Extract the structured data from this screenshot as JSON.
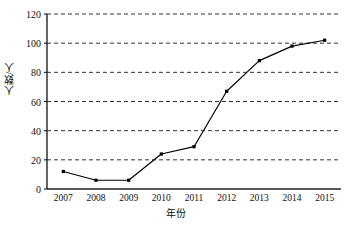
{
  "chart_data": {
    "type": "line",
    "title": "",
    "xlabel": "年份",
    "ylabel": "人数/人",
    "categories": [
      "2007",
      "2008",
      "2009",
      "2010",
      "2011",
      "2012",
      "2013",
      "2014",
      "2015"
    ],
    "values": [
      12,
      6,
      6,
      24,
      29,
      67,
      88,
      98,
      102
    ],
    "series": [
      {
        "name": "人数",
        "values": [
          12,
          6,
          6,
          24,
          29,
          67,
          88,
          98,
          102
        ]
      }
    ],
    "ylim": [
      0,
      120
    ],
    "yticks": [
      0,
      20,
      40,
      60,
      80,
      100,
      120
    ],
    "ytick_labels": [
      "0",
      "20",
      "40",
      "60",
      "80",
      "100",
      "120"
    ],
    "grid": "horizontal-dashed",
    "legend": "none",
    "line_color": "#000000",
    "marker": "square",
    "marker_color": "#000000",
    "background": "#ffffff"
  }
}
